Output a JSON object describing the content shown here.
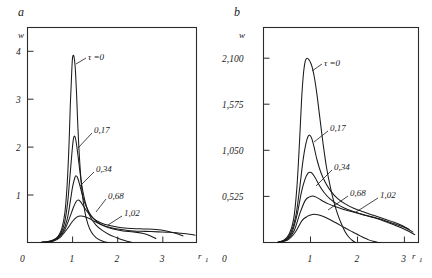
{
  "figure": {
    "background_color": "#ffffff",
    "line_color": "#1a1a1a"
  },
  "panels": [
    {
      "letter": "a",
      "y_axis_name": "w",
      "x_axis_name": "r",
      "x_axis_subscript": "1",
      "origin_label": "0",
      "x_ticks": [
        "1",
        "2",
        "3"
      ],
      "y_ticks": [
        "1",
        "2",
        "3",
        "4"
      ],
      "curve_labels": [
        "τ =0",
        "0,17",
        "0,34",
        "0,68",
        "1,02"
      ]
    },
    {
      "letter": "b",
      "y_axis_name": "w",
      "x_axis_name": "r",
      "x_axis_subscript": "1",
      "origin_label": "0",
      "x_ticks": [
        "1",
        "2",
        "3"
      ],
      "y_ticks": [
        "0,525",
        "1,050",
        "1,575",
        "2,100"
      ],
      "curve_labels": [
        "τ =0",
        "0,17",
        "0,34",
        "0,68",
        "1,02"
      ]
    }
  ],
  "chart_data": [
    {
      "type": "line",
      "panel": "a",
      "title": "a",
      "xlabel": "r_1",
      "ylabel": "w",
      "xlim": [
        0,
        3.75
      ],
      "ylim": [
        0,
        4.45
      ],
      "xticks": [
        1,
        2,
        3
      ],
      "yticks": [
        1,
        2,
        3,
        4
      ],
      "grid": false,
      "legend": "inline-annotations",
      "series": [
        {
          "name": "τ =0",
          "peak_x": 1.02,
          "peak_y": 3.85,
          "x": [
            0.3,
            0.45,
            0.58,
            0.68,
            0.76,
            0.83,
            0.88,
            0.92,
            0.95,
            0.98,
            1.0,
            1.03,
            1.06,
            1.09,
            1.12,
            1.16,
            1.21,
            1.27,
            1.34,
            1.42,
            1.52,
            1.63,
            1.72,
            1.8
          ],
          "y": [
            0.0,
            0.02,
            0.06,
            0.13,
            0.28,
            0.62,
            1.2,
            2.0,
            2.85,
            3.5,
            3.83,
            3.85,
            3.6,
            3.05,
            2.35,
            1.65,
            1.05,
            0.65,
            0.38,
            0.21,
            0.1,
            0.04,
            0.01,
            0.0
          ]
        },
        {
          "name": "0,17",
          "peak_x": 1.05,
          "peak_y": 2.2,
          "x": [
            0.3,
            0.48,
            0.62,
            0.73,
            0.82,
            0.89,
            0.94,
            0.99,
            1.02,
            1.05,
            1.08,
            1.12,
            1.17,
            1.23,
            1.31,
            1.4,
            1.52,
            1.66,
            1.82,
            1.98,
            2.12,
            2.24,
            2.32
          ],
          "y": [
            0.0,
            0.02,
            0.07,
            0.17,
            0.4,
            0.82,
            1.35,
            1.9,
            2.15,
            2.2,
            2.08,
            1.8,
            1.42,
            1.05,
            0.74,
            0.52,
            0.36,
            0.25,
            0.16,
            0.1,
            0.05,
            0.02,
            0.0
          ]
        },
        {
          "name": "0,34",
          "peak_x": 1.08,
          "peak_y": 1.38,
          "x": [
            0.3,
            0.5,
            0.65,
            0.78,
            0.88,
            0.95,
            1.0,
            1.05,
            1.08,
            1.12,
            1.17,
            1.23,
            1.31,
            1.41,
            1.54,
            1.7,
            1.9,
            2.12,
            2.35,
            2.55,
            2.72,
            2.85
          ],
          "y": [
            0.0,
            0.02,
            0.08,
            0.22,
            0.48,
            0.85,
            1.15,
            1.34,
            1.38,
            1.32,
            1.15,
            0.94,
            0.73,
            0.56,
            0.43,
            0.34,
            0.28,
            0.24,
            0.22,
            0.19,
            0.14,
            0.08
          ]
        },
        {
          "name": "0,68",
          "peak_x": 1.12,
          "peak_y": 0.88,
          "x": [
            0.3,
            0.52,
            0.68,
            0.82,
            0.93,
            1.02,
            1.08,
            1.13,
            1.18,
            1.25,
            1.34,
            1.46,
            1.62,
            1.82,
            2.05,
            2.32,
            2.58,
            2.85,
            3.08,
            3.28,
            3.45
          ],
          "y": [
            0.0,
            0.02,
            0.09,
            0.25,
            0.5,
            0.73,
            0.85,
            0.88,
            0.84,
            0.74,
            0.62,
            0.5,
            0.41,
            0.35,
            0.31,
            0.29,
            0.28,
            0.27,
            0.24,
            0.19,
            0.14
          ]
        },
        {
          "name": "1,02",
          "peak_x": 1.18,
          "peak_y": 0.55,
          "x": [
            0.3,
            0.55,
            0.72,
            0.88,
            1.0,
            1.1,
            1.18,
            1.26,
            1.36,
            1.48,
            1.64,
            1.84,
            2.08,
            2.35,
            2.62,
            2.9,
            3.15,
            3.4,
            3.6,
            3.72
          ],
          "y": [
            0.0,
            0.02,
            0.1,
            0.28,
            0.44,
            0.53,
            0.55,
            0.54,
            0.5,
            0.44,
            0.37,
            0.31,
            0.27,
            0.24,
            0.23,
            0.22,
            0.21,
            0.19,
            0.17,
            0.15
          ]
        }
      ]
    },
    {
      "type": "line",
      "panel": "b",
      "title": "b",
      "xlabel": "r_1",
      "ylabel": "w",
      "xlim": [
        0,
        3.3
      ],
      "ylim": [
        0,
        2.45
      ],
      "xticks": [
        1,
        2,
        3
      ],
      "yticks": [
        0.525,
        1.05,
        1.575,
        2.1
      ],
      "grid": false,
      "legend": "inline-annotations",
      "series": [
        {
          "name": "τ =0",
          "peak_x": 0.95,
          "peak_y": 2.1,
          "x": [
            0.3,
            0.44,
            0.55,
            0.64,
            0.71,
            0.77,
            0.81,
            0.85,
            0.89,
            0.93,
            0.97,
            1.01,
            1.05,
            1.09,
            1.14,
            1.2,
            1.27,
            1.34,
            1.42,
            1.5,
            1.58,
            1.66,
            1.74,
            1.82,
            1.9,
            1.96
          ],
          "y": [
            0.0,
            0.03,
            0.1,
            0.26,
            0.62,
            1.18,
            1.62,
            1.92,
            2.07,
            2.1,
            2.08,
            2.04,
            1.97,
            1.86,
            1.68,
            1.42,
            1.12,
            0.86,
            0.64,
            0.46,
            0.32,
            0.21,
            0.12,
            0.06,
            0.02,
            0.0
          ]
        },
        {
          "name": "0,17",
          "peak_x": 0.98,
          "peak_y": 1.22,
          "x": [
            0.3,
            0.46,
            0.58,
            0.69,
            0.77,
            0.84,
            0.9,
            0.95,
            0.99,
            1.03,
            1.08,
            1.14,
            1.22,
            1.32,
            1.44,
            1.58,
            1.74,
            1.92,
            2.12,
            2.34,
            2.56,
            2.78,
            2.96,
            3.1
          ],
          "y": [
            0.0,
            0.03,
            0.11,
            0.31,
            0.62,
            0.93,
            1.12,
            1.21,
            1.22,
            1.18,
            1.08,
            0.94,
            0.8,
            0.68,
            0.58,
            0.5,
            0.44,
            0.39,
            0.35,
            0.31,
            0.27,
            0.23,
            0.19,
            0.15
          ]
        },
        {
          "name": "0,34",
          "peak_x": 1.0,
          "peak_y": 0.8,
          "x": [
            0.3,
            0.48,
            0.61,
            0.72,
            0.81,
            0.89,
            0.95,
            1.0,
            1.05,
            1.11,
            1.19,
            1.29,
            1.41,
            1.56,
            1.73,
            1.93,
            2.15,
            2.4,
            2.64,
            2.86,
            3.05,
            3.18
          ],
          "y": [
            0.0,
            0.03,
            0.12,
            0.33,
            0.58,
            0.73,
            0.79,
            0.8,
            0.78,
            0.73,
            0.65,
            0.57,
            0.5,
            0.44,
            0.39,
            0.35,
            0.31,
            0.28,
            0.24,
            0.2,
            0.16,
            0.12
          ]
        },
        {
          "name": "0,68",
          "peak_x": 1.08,
          "peak_y": 0.53,
          "x": [
            0.3,
            0.5,
            0.65,
            0.78,
            0.89,
            0.98,
            1.05,
            1.11,
            1.18,
            1.27,
            1.38,
            1.52,
            1.69,
            1.89,
            2.12,
            2.38,
            2.64,
            2.88,
            3.08,
            3.22
          ],
          "y": [
            0.0,
            0.03,
            0.13,
            0.34,
            0.48,
            0.52,
            0.53,
            0.52,
            0.5,
            0.47,
            0.44,
            0.41,
            0.38,
            0.35,
            0.32,
            0.28,
            0.23,
            0.18,
            0.13,
            0.09
          ]
        },
        {
          "name": "1,02",
          "peak_x": 1.14,
          "peak_y": 0.32,
          "x": [
            0.3,
            0.52,
            0.68,
            0.82,
            0.94,
            1.04,
            1.12,
            1.2,
            1.3,
            1.42,
            1.56,
            1.72,
            1.9,
            2.08,
            2.24,
            2.36,
            2.44,
            2.5
          ],
          "y": [
            0.0,
            0.03,
            0.12,
            0.25,
            0.3,
            0.32,
            0.32,
            0.31,
            0.29,
            0.26,
            0.22,
            0.17,
            0.12,
            0.07,
            0.03,
            0.01,
            0.0,
            0.0
          ]
        }
      ]
    }
  ]
}
